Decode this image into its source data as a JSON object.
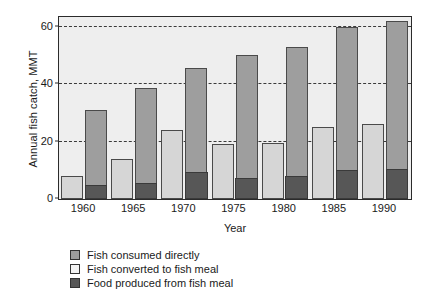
{
  "chart_data": {
    "type": "bar",
    "title": "",
    "xlabel": "Year",
    "ylabel": "Annual fish catch, MMT",
    "categories": [
      "1960",
      "1965",
      "1970",
      "1975",
      "1980",
      "1985",
      "1990"
    ],
    "ylim": [
      0,
      63
    ],
    "yticks": [
      0,
      20,
      40,
      60
    ],
    "ytick_labels": [
      "0",
      "20",
      "40",
      "60"
    ],
    "grid": "horizontal-dashed",
    "legend_position": "below-plot-left",
    "series": [
      {
        "name": "Fish consumed directly",
        "color": "#9e9e9e",
        "note": "total height of the right-hand bar in each year group",
        "values": [
          31,
          38.5,
          45.5,
          50,
          53,
          60,
          62
        ]
      },
      {
        "name": "Fish converted to fish meal",
        "color": "#d6d6d6",
        "note": "left-hand light bar in each year group",
        "values": [
          8,
          14,
          24,
          19,
          19.5,
          25,
          26
        ]
      },
      {
        "name": "Food produced from fish meal",
        "color": "#575757",
        "note": "dark segment at the base of the right-hand bar",
        "values": [
          5,
          5.5,
          9.5,
          7.5,
          8,
          10,
          10.5
        ]
      }
    ]
  },
  "legend": {
    "items": [
      {
        "label": "Fish consumed directly",
        "swatch": "gray"
      },
      {
        "label": "Fish converted to fish meal",
        "swatch": "light"
      },
      {
        "label": "Food produced from fish meal",
        "swatch": "dark"
      }
    ]
  }
}
